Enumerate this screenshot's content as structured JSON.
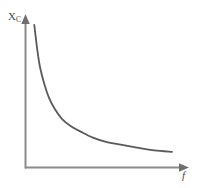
{
  "figure": {
    "title": "",
    "background_color": "#ffffff",
    "axis_color": "#8a8a8a",
    "curve_color": "#5a5a5a",
    "label_color": "#4a4a4a"
  },
  "labels": {
    "y_axis_symbol": "X",
    "y_axis_subscript": "C",
    "x_axis_symbol": "f"
  },
  "chart_data": {
    "type": "line",
    "title": "",
    "subtitle": "",
    "xlabel": "f",
    "ylabel": "X_C",
    "x_tick_labels": [],
    "y_tick_labels": [],
    "grid": false,
    "legend": null,
    "annotations": [],
    "axis_arrows": {
      "x_axis": true,
      "y_axis": true
    },
    "xlim": [
      0,
      1
    ],
    "ylim": [
      0,
      1
    ],
    "relationship": "X_C is inversely proportional to f",
    "series": [
      {
        "name": "capacitive reactance",
        "color": "#5a5a5a",
        "x": [
          0.06,
          0.08,
          0.1,
          0.13,
          0.16,
          0.2,
          0.25,
          0.31,
          0.38,
          0.46,
          0.55,
          0.65,
          0.76,
          0.88,
          1.0
        ],
        "y": [
          1.0,
          0.83,
          0.7,
          0.58,
          0.49,
          0.41,
          0.34,
          0.29,
          0.25,
          0.21,
          0.18,
          0.16,
          0.14,
          0.12,
          0.11
        ]
      }
    ]
  }
}
